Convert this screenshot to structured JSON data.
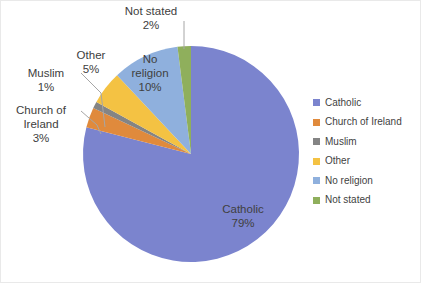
{
  "chart_data": {
    "type": "pie",
    "title": "",
    "legend_position": "right",
    "start_angle_deg": 0,
    "direction": "clockwise",
    "categories": [
      "Catholic",
      "Church of Ireland",
      "Muslim",
      "Other",
      "No religion",
      "Not stated"
    ],
    "values": [
      79,
      3,
      1,
      5,
      10,
      2
    ],
    "unit": "%",
    "colors": [
      "#7b84ce",
      "#e08a3c",
      "#848484",
      "#f4c243",
      "#8fb0dd",
      "#8faf5c"
    ],
    "slices": [
      {
        "label": "Catholic",
        "value": 79,
        "display": "79%",
        "color": "#7b84ce",
        "label_placement": "inside",
        "label_color": "#ffffff",
        "leader_line": false
      },
      {
        "label": "Church of Ireland",
        "value": 3,
        "display": "3%",
        "color": "#e08a3c",
        "label_placement": "outside",
        "label_color": "#404040",
        "leader_line": true
      },
      {
        "label": "Muslim",
        "value": 1,
        "display": "1%",
        "color": "#848484",
        "label_placement": "outside",
        "label_color": "#404040",
        "leader_line": true
      },
      {
        "label": "Other",
        "value": 5,
        "display": "5%",
        "color": "#f4c243",
        "label_placement": "outside",
        "label_color": "#404040",
        "leader_line": true
      },
      {
        "label": "No religion",
        "value": 10,
        "display": "10%",
        "color": "#8fb0dd",
        "label_placement": "inside",
        "label_color": "#404040",
        "leader_line": false
      },
      {
        "label": "Not stated",
        "value": 2,
        "display": "2%",
        "color": "#8faf5c",
        "label_placement": "outside",
        "label_color": "#404040",
        "leader_line": true
      }
    ]
  },
  "geometry": {
    "center_x": 190,
    "center_y": 153,
    "radius": 108
  },
  "labels": [
    {
      "name": "label-not-stated",
      "lines": [
        "Not stated",
        "2%"
      ],
      "x": 150,
      "y": 14,
      "anchor": "middle",
      "color": "#404040",
      "leader": [
        [
          183,
          20
        ],
        [
          183,
          45
        ],
        [
          183,
          48
        ]
      ]
    },
    {
      "name": "label-other",
      "lines": [
        "Other",
        "5%"
      ],
      "x": 90,
      "y": 58,
      "anchor": "middle",
      "color": "#404040",
      "leader": null
    },
    {
      "name": "label-muslim",
      "lines": [
        "Muslim",
        "1%"
      ],
      "x": 45,
      "y": 76,
      "anchor": "middle",
      "color": "#404040",
      "leader": [
        [
          80,
          72
        ],
        [
          100,
          92
        ],
        [
          104,
          126
        ]
      ]
    },
    {
      "name": "label-church-of-ireland",
      "lines": [
        "Church of",
        "Ireland",
        "3%"
      ],
      "x": 40,
      "y": 113,
      "anchor": "middle",
      "color": "#404040",
      "leader": [
        [
          80,
          110
        ],
        [
          96,
          124
        ],
        [
          100,
          133
        ]
      ]
    },
    {
      "name": "label-catholic",
      "lines": [
        "Catholic",
        "79%"
      ],
      "x": 242,
      "y": 212,
      "anchor": "middle",
      "color": "#ffffff",
      "leader": null
    },
    {
      "name": "label-no-religion",
      "lines": [
        "No",
        "religion",
        "10%"
      ],
      "x": 149,
      "y": 62,
      "anchor": "middle",
      "color": "#404040",
      "leader": null
    }
  ],
  "legend": {
    "items": [
      {
        "label": "Catholic",
        "color": "#7b84ce"
      },
      {
        "label": "Church of Ireland",
        "color": "#e08a3c"
      },
      {
        "label": "Muslim",
        "color": "#848484"
      },
      {
        "label": "Other",
        "color": "#f4c243"
      },
      {
        "label": "No religion",
        "color": "#8fb0dd"
      },
      {
        "label": "Not stated",
        "color": "#8faf5c"
      }
    ]
  }
}
